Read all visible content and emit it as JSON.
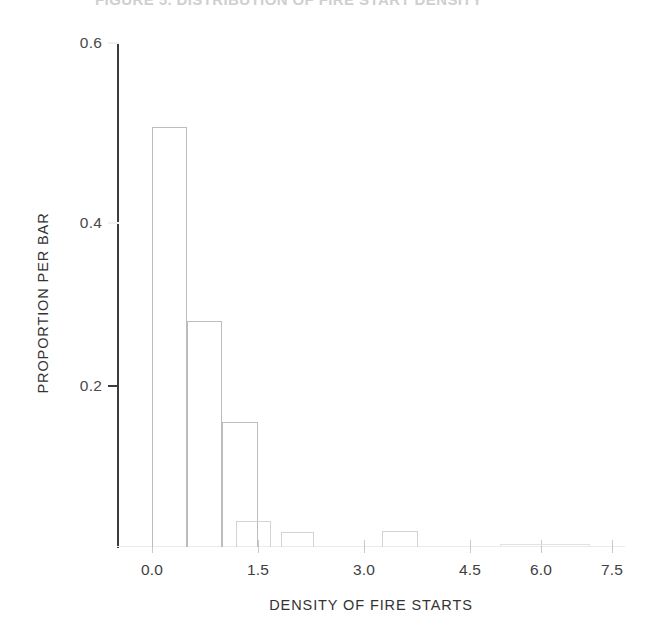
{
  "figure": {
    "title": "FIGURE 5. DISTRIBUTION OF FIRE START DENSITY"
  },
  "axes": {
    "y_title": "PROPORTION PER BAR",
    "x_title": "DENSITY OF FIRE STARTS",
    "y_ticks": [
      "0.6",
      "0.4",
      "0.2"
    ],
    "x_ticks": [
      "0.0",
      "1.5",
      "3.0",
      "4.5",
      "6.0",
      "7.5"
    ]
  },
  "chart_data": {
    "type": "bar",
    "title": "FIGURE 5. DISTRIBUTION OF FIRE START DENSITY",
    "xlabel": "DENSITY OF FIRE STARTS",
    "ylabel": "PROPORTION PER BAR",
    "xlim": [
      -0.5,
      8.0
    ],
    "ylim": [
      0.0,
      0.6
    ],
    "xticks": [
      0.0,
      1.5,
      3.0,
      4.5,
      6.0,
      7.5
    ],
    "yticks": [
      0.2,
      0.4,
      0.6
    ],
    "grid": false,
    "legend": null,
    "bin_width": 0.5,
    "bin_starts": [
      0.0,
      0.5,
      1.0,
      1.5,
      2.0,
      2.5,
      3.0,
      3.5,
      4.0,
      4.5,
      5.0,
      5.5,
      6.0,
      6.5,
      7.0,
      7.5
    ],
    "categories": [
      "0.0-0.5",
      "0.5-1.0",
      "1.0-1.5",
      "1.5-2.0",
      "2.0-2.5",
      "2.5-3.0",
      "3.0-3.5",
      "3.5-4.0",
      "4.0-4.5",
      "4.5-5.0",
      "5.0-5.5",
      "5.5-6.0",
      "6.0-6.5",
      "6.5-7.0",
      "7.0-7.5",
      "7.5-8.0"
    ],
    "values": [
      0.5,
      0.265,
      0.154,
      0.032,
      0.018,
      0.018,
      0.0,
      0.0,
      0.02,
      0.0,
      0.0,
      0.0,
      0.0,
      0.002,
      0.002,
      0.002
    ]
  },
  "bars": [
    {
      "name": "bin-0.0-0.5",
      "left": 152,
      "width": 35,
      "top": 127,
      "height": 420,
      "weight": "strong"
    },
    {
      "name": "bin-0.5-1.0",
      "left": 187,
      "width": 35,
      "top": 321,
      "height": 226,
      "weight": "strong"
    },
    {
      "name": "bin-1.0-1.5",
      "left": 222,
      "width": 36,
      "top": 422,
      "height": 125,
      "weight": "strong"
    },
    {
      "name": "bin-1.5-2.0",
      "left": 236,
      "width": 35,
      "top": 521,
      "height": 26,
      "weight": "normal"
    },
    {
      "name": "bin-2.5-3.0",
      "left": 281,
      "width": 33,
      "top": 532,
      "height": 15,
      "weight": "normal"
    },
    {
      "name": "bin-4.0-4.5",
      "left": 382,
      "width": 36,
      "top": 531,
      "height": 16,
      "weight": "normal"
    },
    {
      "name": "bin-6.5-7.5",
      "left": 500,
      "width": 90,
      "top": 544,
      "height": 3,
      "weight": "flat"
    }
  ],
  "y_tick_geometry": [
    {
      "name": "y-tick-0.6",
      "top": 42,
      "faint": true,
      "label_top": 34
    },
    {
      "name": "y-tick-0.4",
      "top": 222,
      "faint": true,
      "label_top": 214
    },
    {
      "name": "y-tick-0.2",
      "top": 385,
      "faint": false,
      "label_top": 377
    }
  ],
  "x_tick_geometry": [
    {
      "name": "x-tick-0.0",
      "left": 152
    },
    {
      "name": "x-tick-1.5",
      "left": 258
    },
    {
      "name": "x-tick-3.0",
      "left": 364
    },
    {
      "name": "x-tick-4.5",
      "left": 470
    },
    {
      "name": "x-tick-6.0",
      "left": 541
    },
    {
      "name": "x-tick-7.5",
      "left": 612
    }
  ]
}
